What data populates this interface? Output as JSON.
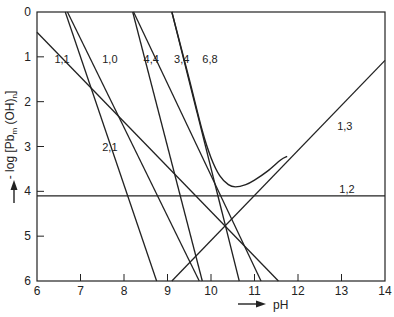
{
  "chart_data": {
    "type": "line",
    "title": "",
    "xlabel": "pH",
    "ylabel": "- log [Pb_m (OH)_n]",
    "xlim": [
      6,
      14
    ],
    "ylim": [
      0,
      6
    ],
    "y_inverted": true,
    "grid": false,
    "xticks": [
      6,
      7,
      8,
      9,
      10,
      11,
      12,
      13,
      14
    ],
    "yticks": [
      0,
      1,
      2,
      3,
      4,
      5,
      6
    ],
    "series": [
      {
        "name": "1,1",
        "points": [
          [
            6.0,
            0.45
          ],
          [
            11.55,
            6.0
          ]
        ],
        "label_at": [
          6.4,
          1.05
        ]
      },
      {
        "name": "1,0",
        "points": [
          [
            6.7,
            0.0
          ],
          [
            9.73,
            6.0
          ]
        ],
        "label_at": [
          7.5,
          1.05
        ]
      },
      {
        "name": "2,1",
        "points": [
          [
            6.65,
            0.0
          ],
          [
            8.75,
            6.0
          ]
        ],
        "label_at": [
          7.5,
          3.0
        ]
      },
      {
        "name": "4,4",
        "points": [
          [
            8.2,
            0.0
          ],
          [
            9.8,
            6.0
          ]
        ],
        "label_at": [
          8.45,
          1.05
        ]
      },
      {
        "name": "3,4",
        "points": [
          [
            8.22,
            0.0
          ],
          [
            11.15,
            6.0
          ]
        ],
        "label_at": [
          9.15,
          1.05
        ]
      },
      {
        "name": "6,8",
        "points": [
          [
            9.1,
            0.0
          ],
          [
            10.65,
            6.0
          ]
        ],
        "label_at": [
          9.8,
          1.05
        ]
      },
      {
        "name": "1,2",
        "points": [
          [
            6.0,
            4.1
          ],
          [
            14.0,
            4.1
          ]
        ],
        "label_at": [
          12.95,
          3.95
        ]
      },
      {
        "name": "1,3",
        "points": [
          [
            9.1,
            6.0
          ],
          [
            14.0,
            1.08
          ]
        ],
        "label_at": [
          12.9,
          2.55
        ]
      }
    ],
    "total_curve": {
      "name": "total solubility",
      "points": [
        [
          9.1,
          0.0
        ],
        [
          9.5,
          1.5
        ],
        [
          9.8,
          2.65
        ],
        [
          10.0,
          3.25
        ],
        [
          10.2,
          3.65
        ],
        [
          10.4,
          3.85
        ],
        [
          10.56,
          3.9
        ],
        [
          10.8,
          3.85
        ],
        [
          11.0,
          3.75
        ],
        [
          11.3,
          3.55
        ],
        [
          11.6,
          3.3
        ],
        [
          11.75,
          3.22
        ]
      ]
    },
    "annotations": [
      "pH arrow",
      "y-axis arrow"
    ]
  }
}
